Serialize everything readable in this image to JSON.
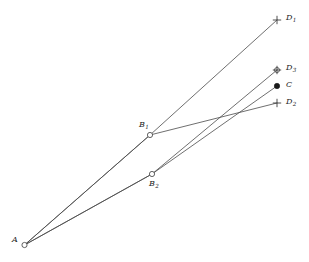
{
  "figure": {
    "background_color": "#ffffff",
    "line_color": "#4a4a4a",
    "label_color": "#1c1c1c",
    "width": 309,
    "height": 262
  },
  "points": [
    {
      "id": "A",
      "label": "A",
      "subscript": "",
      "marker": "open-circle",
      "x": 24.5,
      "y": 245.0,
      "label_x": 12,
      "label_y": 236
    },
    {
      "id": "B1",
      "label": "B",
      "subscript": "1",
      "marker": "open-circle",
      "x": 150.0,
      "y": 135.0,
      "label_x": 139,
      "label_y": 121
    },
    {
      "id": "B2",
      "label": "B",
      "subscript": "2",
      "marker": "open-circle",
      "x": 152.0,
      "y": 174.0,
      "label_x": 149,
      "label_y": 180
    },
    {
      "id": "D1",
      "label": "D",
      "subscript": "1",
      "marker": "cross",
      "x": 277.0,
      "y": 20.0,
      "label_x": 286,
      "label_y": 14
    },
    {
      "id": "D3",
      "label": "D",
      "subscript": "3",
      "marker": "circled-cross",
      "x": 277.0,
      "y": 70.0,
      "label_x": 286,
      "label_y": 64
    },
    {
      "id": "C",
      "label": "C",
      "subscript": "",
      "marker": "filled-dot",
      "x": 277.0,
      "y": 86.0,
      "label_x": 286,
      "label_y": 81
    },
    {
      "id": "D2",
      "label": "D",
      "subscript": "2",
      "marker": "cross",
      "x": 277.0,
      "y": 103.0,
      "label_x": 286,
      "label_y": 98
    }
  ],
  "paths": [
    {
      "id": "A-B1-D1",
      "from": "A",
      "via": "B1",
      "to": "D1",
      "d": "M 24.5 245 L 150 135 L 277 20"
    },
    {
      "id": "A-B1-D2",
      "from": "A",
      "via": "B1",
      "to": "D2",
      "d": "M 24.5 245 L 150 135 L 277 103"
    },
    {
      "id": "A-B2-D3",
      "from": "A",
      "via": "B2",
      "to": "D3",
      "d": "M 24.5 245 L 152 174 L 277 70"
    },
    {
      "id": "A-B2-C",
      "from": "A",
      "via": "B2",
      "to": "C",
      "d": "M 24.5 245 L 152 174 L 277 86"
    }
  ]
}
